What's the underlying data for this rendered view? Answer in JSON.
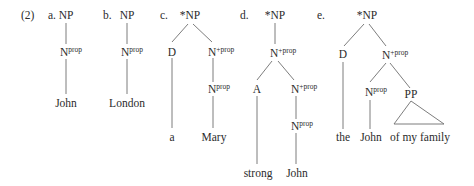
{
  "example_number": "(2)",
  "colors": {
    "text": "#2b2b2b",
    "edge": "#6e6e6e",
    "background": "#ffffff"
  },
  "trees": [
    {
      "label": "a.",
      "nodes": [
        {
          "id": "a0",
          "cat": "NP",
          "sup": ""
        },
        {
          "id": "a1",
          "cat": "N",
          "sup": "prop"
        },
        {
          "id": "a2",
          "cat": "John",
          "sup": ""
        }
      ]
    },
    {
      "label": "b.",
      "nodes": [
        {
          "id": "b0",
          "cat": "NP",
          "sup": ""
        },
        {
          "id": "b1",
          "cat": "N",
          "sup": "prop"
        },
        {
          "id": "b2",
          "cat": "London",
          "sup": ""
        }
      ]
    },
    {
      "label": "c.",
      "nodes": [
        {
          "id": "c0",
          "cat": "*NP",
          "sup": ""
        },
        {
          "id": "c1",
          "cat": "D",
          "sup": ""
        },
        {
          "id": "c2",
          "cat": "N",
          "sup": "+prop"
        },
        {
          "id": "c3",
          "cat": "N",
          "sup": "prop"
        },
        {
          "id": "c4",
          "cat": "a",
          "sup": ""
        },
        {
          "id": "c5",
          "cat": "Mary",
          "sup": ""
        }
      ]
    },
    {
      "label": "d.",
      "nodes": [
        {
          "id": "d0",
          "cat": "*NP",
          "sup": ""
        },
        {
          "id": "d1",
          "cat": "N",
          "sup": "+prop"
        },
        {
          "id": "d2",
          "cat": "A",
          "sup": ""
        },
        {
          "id": "d3",
          "cat": "N",
          "sup": "+prop"
        },
        {
          "id": "d4",
          "cat": "N",
          "sup": "prop"
        },
        {
          "id": "d5",
          "cat": "strong",
          "sup": ""
        },
        {
          "id": "d6",
          "cat": "John",
          "sup": ""
        }
      ]
    },
    {
      "label": "e.",
      "nodes": [
        {
          "id": "e0",
          "cat": "*NP",
          "sup": ""
        },
        {
          "id": "e1",
          "cat": "D",
          "sup": ""
        },
        {
          "id": "e2",
          "cat": "N",
          "sup": "+prop"
        },
        {
          "id": "e3",
          "cat": "N",
          "sup": "prop"
        },
        {
          "id": "e4",
          "cat": "PP",
          "sup": ""
        },
        {
          "id": "e5",
          "cat": "the",
          "sup": ""
        },
        {
          "id": "e6",
          "cat": "John",
          "sup": ""
        },
        {
          "id": "e7",
          "cat": "of my family",
          "sup": ""
        }
      ]
    }
  ]
}
